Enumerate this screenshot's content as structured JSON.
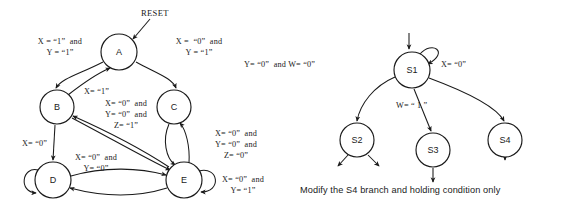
{
  "figure": {
    "background_color": "#ffffff",
    "ink_color": "#1a1a1a"
  },
  "left_diagram": {
    "name": "state-transition-diagram-abcde",
    "reset_label": "RESET",
    "states": [
      {
        "id": "A",
        "label": "A",
        "cx": 119,
        "cy": 52,
        "r": 18
      },
      {
        "id": "B",
        "label": "B",
        "cx": 57,
        "cy": 107,
        "r": 17
      },
      {
        "id": "C",
        "label": "C",
        "cx": 174,
        "cy": 107,
        "r": 17
      },
      {
        "id": "D",
        "label": "D",
        "cx": 53,
        "cy": 180,
        "r": 18
      },
      {
        "id": "E",
        "label": "E",
        "cx": 184,
        "cy": 180,
        "r": 18
      }
    ],
    "transitions": [
      {
        "from": "A",
        "to": "B",
        "label": "X = “1”  and\nY = “1”"
      },
      {
        "from": "A",
        "to": "C",
        "label": "X =  “0”  and\nY = “1”"
      },
      {
        "from": "B",
        "to": "A",
        "label": "X= “1”"
      },
      {
        "from": "B",
        "to": "E",
        "label": "X= “0”  and\nY= “0”  and\nZ= “1”"
      },
      {
        "from": "B",
        "to": "D",
        "label": "X= “0”"
      },
      {
        "from": "C",
        "to": "E",
        "label": "X= “0”  and\nY= “0”  and\nZ= “0”"
      },
      {
        "from": "E",
        "to": "C",
        "label": ""
      },
      {
        "from": "D",
        "to": "E",
        "label": "X= “0”  and\nY= “0”"
      },
      {
        "from": "E",
        "to": "D",
        "label": ""
      },
      {
        "from": "E",
        "to": "B",
        "label": ""
      },
      {
        "from": "D",
        "to": "D",
        "label": ""
      },
      {
        "from": "E",
        "to": "E",
        "label": "X= “0”  and\nY= “1”"
      }
    ]
  },
  "right_diagram": {
    "name": "state-transition-diagram-s1-s4",
    "states": [
      {
        "id": "S1",
        "label": "S1",
        "cx": 412,
        "cy": 70,
        "r": 18
      },
      {
        "id": "S2",
        "label": "S2",
        "cx": 357,
        "cy": 140,
        "r": 17
      },
      {
        "id": "S3",
        "label": "S3",
        "cx": 433,
        "cy": 150,
        "r": 17
      },
      {
        "id": "S4",
        "label": "S4",
        "cx": 505,
        "cy": 140,
        "r": 17
      }
    ],
    "transitions": [
      {
        "from": "S1",
        "to": "S2",
        "label": "Y= “0”  and W= “0”"
      },
      {
        "from": "S1",
        "to": "S3",
        "label": "W= “ 1 ”"
      },
      {
        "from": "S1",
        "to": "S4",
        "label": "X= “0”"
      },
      {
        "from": "S1",
        "to": "S1",
        "label": ""
      }
    ],
    "caption": "Modify the S4 branch and holding condition only"
  }
}
